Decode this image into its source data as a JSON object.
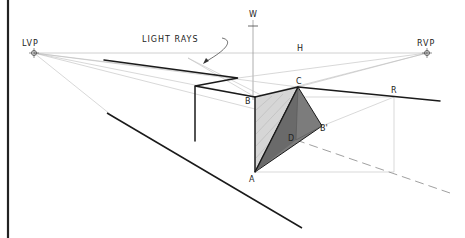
{
  "diagram": {
    "labels": {
      "lvp": "LVP",
      "rvp": "RVP",
      "horizon": "H",
      "vertical": "W",
      "light_rays": "LIGHT RAYS",
      "point_a": "A",
      "point_b": "B",
      "point_c": "C",
      "point_d": "D",
      "point_b_prime": "B'",
      "point_r": "R"
    },
    "colors": {
      "line": "#1a1a1a",
      "construction": "#b5b5b5",
      "shadow_light": "#d0d0d0",
      "shadow_dark": "#7a7a7a",
      "border": "#222222"
    },
    "points": {
      "LVP": [
        34,
        53
      ],
      "RVP": [
        427,
        53
      ],
      "A": [
        255,
        172
      ],
      "B": [
        255,
        97
      ],
      "C": [
        298,
        87
      ],
      "D": [
        296,
        140
      ],
      "B_prime": [
        322,
        126
      ],
      "R": [
        394,
        97
      ]
    }
  }
}
